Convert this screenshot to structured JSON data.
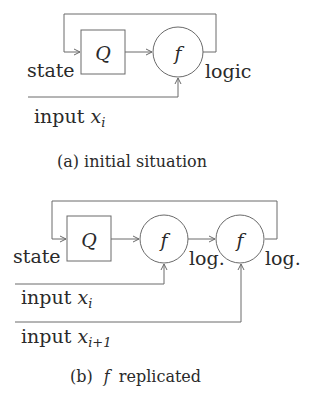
{
  "figure_a": {
    "state_label": "state",
    "register_label": "Q",
    "function_label": "f",
    "output_label": "logic",
    "input_label": "input",
    "input_var": "x",
    "input_sub": "i",
    "caption": "(a)  initial situation"
  },
  "figure_b": {
    "state_label": "state",
    "register_label": "Q",
    "function1_label": "f",
    "function2_label": "f",
    "output1_label": "log.",
    "output2_label": "log.",
    "input1_label": "input",
    "input1_var": "x",
    "input1_sub": "i",
    "input2_label": "input",
    "input2_var": "x",
    "input2_sub": "i+1",
    "caption_prefix": "(b)",
    "caption_var": "f",
    "caption_rest": "replicated"
  }
}
